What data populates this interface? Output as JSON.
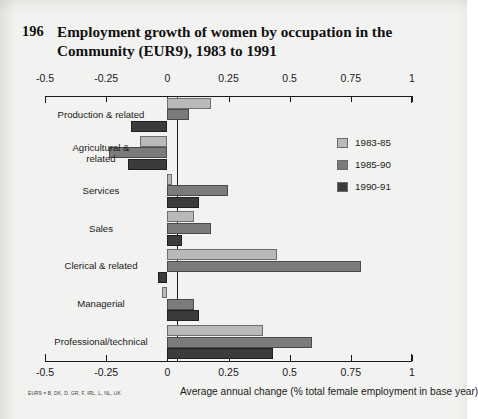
{
  "figure": {
    "number": "196",
    "title": "Employment growth of women by occupation in the Community (EUR9), 1983 to 1991",
    "footnote": "EUR9 = B, DK, D, GR, F, IRL, L, NL, UK",
    "xcaption": "Average annual change (% total female employment in base year)"
  },
  "legend": {
    "position": "right-inside",
    "items": [
      {
        "label": "1983-85",
        "color": "#b9b9b7"
      },
      {
        "label": "1985-90",
        "color": "#7b7b79"
      },
      {
        "label": "1990-91",
        "color": "#3b3b3a"
      }
    ]
  },
  "chart_data": {
    "type": "bar",
    "orientation": "horizontal",
    "title": "Employment growth of women by occupation in the Community (EUR9), 1983 to 1991",
    "xlabel": "Average annual change (% total female employment in base year)",
    "ylabel": "",
    "xlim": [
      -0.5,
      1
    ],
    "xticks": [
      -0.5,
      -0.25,
      0,
      0.25,
      0.5,
      0.75,
      1
    ],
    "xticklabels": [
      "-0.5",
      "-0.25",
      "0",
      "0.25",
      "0.5",
      "0.75",
      "1"
    ],
    "grid": false,
    "axes": [
      "top",
      "bottom"
    ],
    "categories": [
      "Production & related",
      "Agricultural &\nrelated",
      "Services",
      "Sales",
      "Clerical & related",
      "Managerial",
      "Professional/technical"
    ],
    "series": [
      {
        "name": "1983-85",
        "color": "#b9b9b7",
        "values": [
          0.18,
          -0.11,
          0.02,
          0.11,
          0.45,
          -0.02,
          0.39
        ]
      },
      {
        "name": "1985-90",
        "color": "#7b7b79",
        "values": [
          0.09,
          -0.24,
          0.25,
          0.18,
          0.79,
          0.11,
          0.59
        ]
      },
      {
        "name": "1990-91",
        "color": "#3b3b3a",
        "values": [
          -0.15,
          -0.16,
          0.13,
          0.06,
          -0.04,
          0.13,
          0.43
        ]
      }
    ]
  }
}
